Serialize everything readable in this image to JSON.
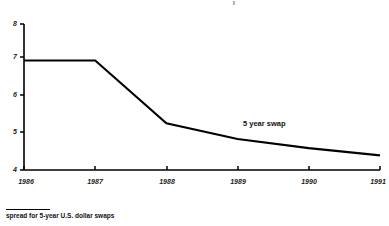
{
  "figure": {
    "background_color": "#ffffff",
    "line_color": "#000000",
    "text_color": "#111111"
  },
  "footnote": {
    "text": "spread for 5-year U.S. dollar swaps"
  },
  "annotation": {
    "series_label": "5 year swap"
  },
  "chart_data": {
    "type": "line",
    "title": "",
    "subtitle": "",
    "xlabel": "",
    "ylabel": "",
    "x": [
      1986,
      1987,
      1988,
      1989,
      1990,
      1991
    ],
    "categories": [
      "1986",
      "1987",
      "1988",
      "1989",
      "1990",
      "1991"
    ],
    "series": [
      {
        "name": "5 year swap",
        "values": [
          7.0,
          7.0,
          5.28,
          4.85,
          4.6,
          4.4
        ]
      }
    ],
    "values": [
      7.0,
      7.0,
      5.28,
      4.85,
      4.6,
      4.4
    ],
    "xlim": [
      1986,
      1991
    ],
    "ylim": [
      4,
      8
    ],
    "ytick_labels": [
      "8",
      "7",
      "6",
      "5",
      "4"
    ],
    "ytick_values": [
      8,
      7,
      6,
      5,
      4
    ],
    "xtick_labels": [
      "1986",
      "1987",
      "1988",
      "1989",
      "1990",
      "1991"
    ],
    "grid": false,
    "legend": "none",
    "annotations": [
      {
        "text": "5 year swap",
        "x": 1989.1,
        "y": 5.25
      }
    ]
  }
}
